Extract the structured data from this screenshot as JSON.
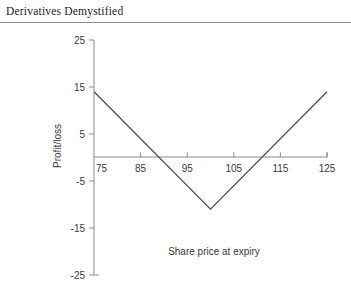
{
  "page": {
    "running_head": "Derivatives Demystified"
  },
  "chart_data": {
    "type": "line",
    "title": "",
    "xlabel": "Share price at expiry",
    "ylabel": "Profit/loss",
    "xlim": [
      75,
      125
    ],
    "ylim": [
      -25,
      25
    ],
    "grid": false,
    "legend": null,
    "xticks": [
      75,
      85,
      95,
      105,
      115,
      125
    ],
    "yticks": [
      25,
      15,
      5,
      -5,
      -15,
      -25
    ],
    "xtick_labels": [
      "75",
      "85",
      "95",
      "105",
      "115",
      "125"
    ],
    "ytick_labels": [
      "25",
      "15",
      "5",
      "-5",
      "-15",
      "-25"
    ],
    "series": [
      {
        "name": "Profit/loss at expiry",
        "x": [
          75,
          100,
          125
        ],
        "values": [
          14,
          -11,
          14
        ],
        "color": "#4d4d4d"
      }
    ],
    "zero_crossings": [
      89,
      111
    ],
    "axis_color": "#8c8c8c"
  }
}
